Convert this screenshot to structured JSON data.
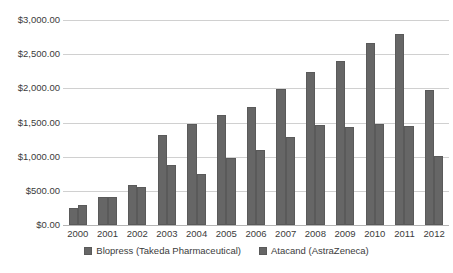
{
  "chart_data": {
    "type": "bar",
    "title": "",
    "subtitle": "",
    "xlabel": "",
    "ylabel": "",
    "categories": [
      "2000",
      "2001",
      "2002",
      "2003",
      "2004",
      "2005",
      "2006",
      "2007",
      "2008",
      "2009",
      "2010",
      "2011",
      "2012"
    ],
    "series": [
      {
        "name": "Blopress (Takeda Pharmaceutical)",
        "color": "#666666",
        "values": [
          250,
          410,
          585,
          1320,
          1480,
          1615,
          1730,
          1990,
          2235,
          2405,
          2665,
          2790,
          1970
        ]
      },
      {
        "name": "Atacand (AstraZeneca)",
        "color": "#666666",
        "values": [
          290,
          415,
          560,
          880,
          745,
          975,
          1105,
          1285,
          1465,
          1435,
          1485,
          1445,
          1005
        ]
      }
    ],
    "ylim": [
      0,
      3000
    ],
    "ytick_values": [
      0,
      500,
      1000,
      1500,
      2000,
      2500,
      3000
    ],
    "ytick_labels": [
      "$0.00",
      "$500.00",
      "$1,000.00",
      "$1,500.00",
      "$2,000.00",
      "$2,500.00",
      "$3,000.00"
    ],
    "grid": true,
    "grid_axis": "y",
    "legend_position": "bottom",
    "legend_entries": [
      "Blopress (Takeda Pharmaceutical)",
      "Atacand (AstraZeneca)"
    ],
    "annotations": []
  },
  "colors": {
    "bar_fill": "#666666",
    "bar_stroke": "#5a5a5a",
    "gridline": "#d0d0d0",
    "baseline": "#b4b4b4",
    "text": "#3b3b3b",
    "background": "#ffffff"
  }
}
